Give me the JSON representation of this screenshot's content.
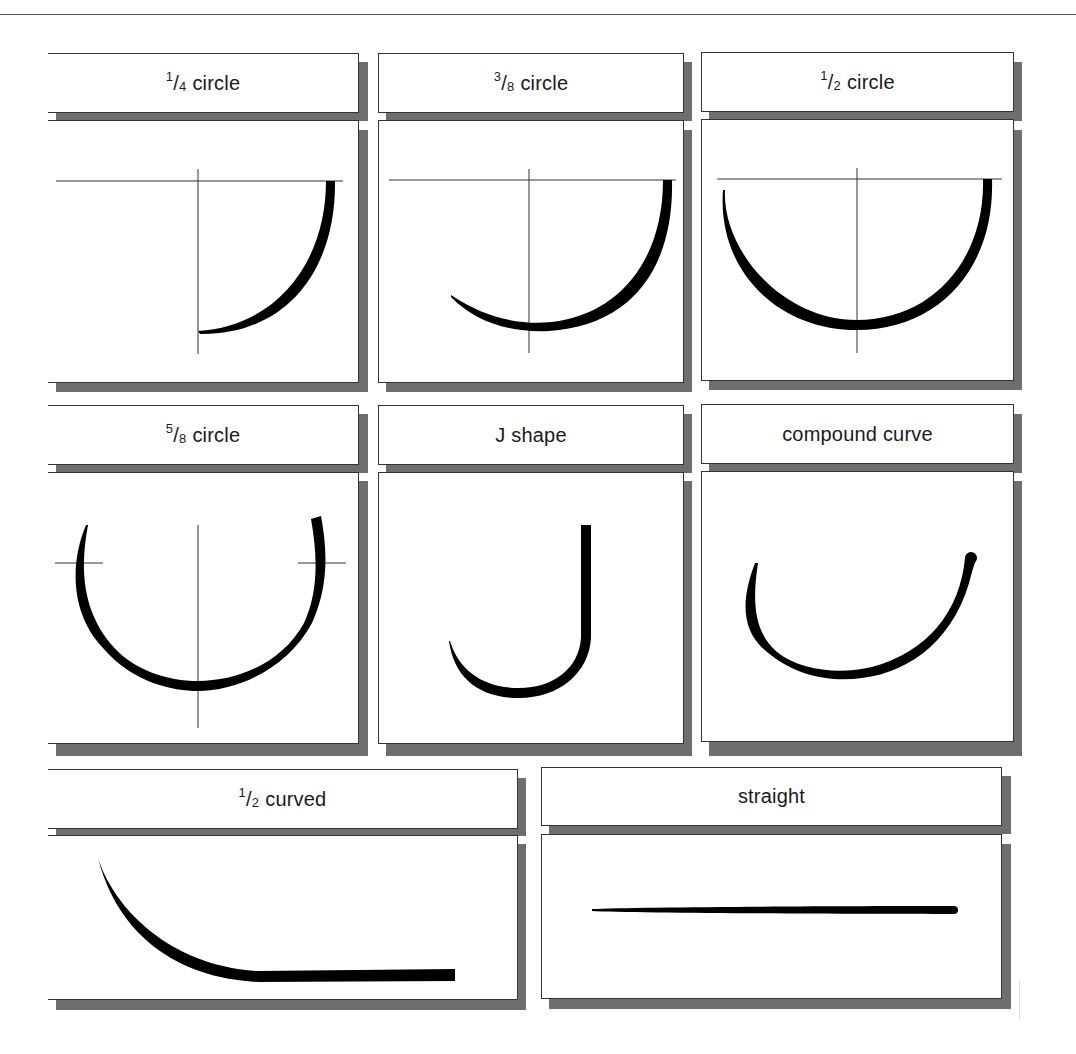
{
  "panels": [
    {
      "id": "quarter-circle",
      "label_frac": {
        "num": "1",
        "den": "4"
      },
      "label_text": "circle"
    },
    {
      "id": "three-eighths-circle",
      "label_frac": {
        "num": "3",
        "den": "8"
      },
      "label_text": "circle"
    },
    {
      "id": "half-circle",
      "label_frac": {
        "num": "1",
        "den": "2"
      },
      "label_text": "circle"
    },
    {
      "id": "five-eighths-circle",
      "label_frac": {
        "num": "5",
        "den": "8"
      },
      "label_text": "circle"
    },
    {
      "id": "j-shape",
      "label_frac": null,
      "label_text": "J shape"
    },
    {
      "id": "compound-curve",
      "label_frac": null,
      "label_text": "compound curve"
    },
    {
      "id": "half-curved",
      "label_frac": {
        "num": "1",
        "den": "2"
      },
      "label_text": "curved"
    },
    {
      "id": "straight",
      "label_frac": null,
      "label_text": "straight"
    }
  ],
  "colors": {
    "ink": "#000000",
    "shadow": "#6e6e6e",
    "border": "#333333",
    "guide": "#333333"
  }
}
